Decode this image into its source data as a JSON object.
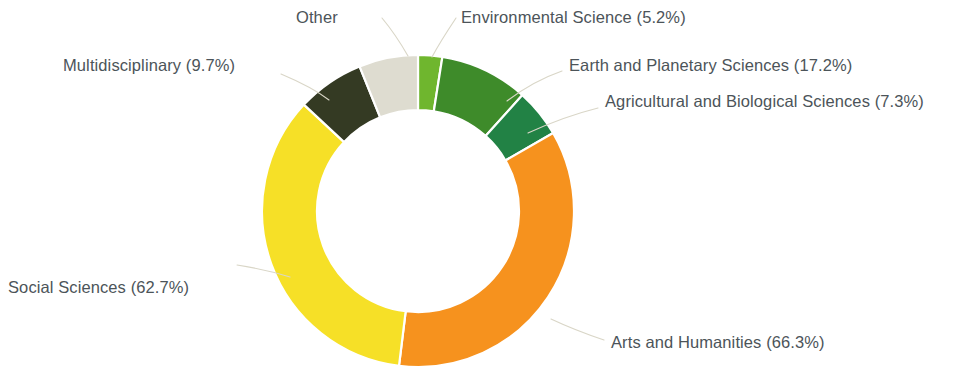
{
  "chart_data": {
    "type": "pie",
    "variant": "donut",
    "title": "",
    "subtitle": "",
    "xlabel": "",
    "ylabel": "",
    "legend_position": "none",
    "labels_position": "outside-with-leader-lines",
    "grid": false,
    "value_unit": "percent",
    "categories": [
      "Environmental Science",
      "Earth and Planetary Sciences",
      "Agricultural and Biological Sciences",
      "Arts and Humanities",
      "Social Sciences",
      "Multidisciplinary",
      "Other"
    ],
    "values": [
      5.2,
      17.2,
      7.3,
      66.3,
      62.7,
      9.7,
      0
    ],
    "slices": [
      {
        "name": "Environmental Science",
        "value": 5.2,
        "label": "Environmental Science (5.2%)",
        "color": "#6FB62E",
        "start_angle": 0,
        "end_angle": 9,
        "leader_name": "leader-environmental-science"
      },
      {
        "name": "Earth and Planetary Sciences",
        "value": 17.2,
        "label": "Earth and Planetary Sciences (17.2%)",
        "color": "#3E8B2A",
        "start_angle": 9,
        "end_angle": 42,
        "leader_name": "leader-earth-and-planetary-sciences"
      },
      {
        "name": "Agricultural and Biological Sciences",
        "value": 7.3,
        "label": "Agricultural and Biological Sciences (7.3%)",
        "color": "#228245",
        "start_angle": 42,
        "end_angle": 60,
        "leader_name": "leader-agricultural-and-biological-sciences"
      },
      {
        "name": "Arts and Humanities",
        "value": 66.3,
        "label": "Arts and Humanities (66.3%)",
        "color": "#F6921E",
        "start_angle": 60,
        "end_angle": 187,
        "leader_name": "leader-arts-and-humanities"
      },
      {
        "name": "Social Sciences",
        "value": 62.7,
        "label": "Social Sciences (62.7%)",
        "color": "#F6E027",
        "start_angle": 187,
        "end_angle": 313,
        "leader_name": "leader-social-sciences"
      },
      {
        "name": "Multidisciplinary",
        "value": 9.7,
        "label": "Multidisciplinary (9.7%)",
        "color": "#343A23",
        "start_angle": 313,
        "end_angle": 338,
        "leader_name": "leader-multidisciplinary"
      },
      {
        "name": "Other",
        "value": null,
        "label": "Other",
        "color": "#DEDCD0",
        "start_angle": 338,
        "end_angle": 360,
        "leader_name": "leader-other"
      }
    ],
    "geometry": {
      "center_x": 418,
      "center_y": 211,
      "outer_radius": 156,
      "inner_radius": 101
    },
    "colors": {
      "environmental_science": "#6FB62E",
      "earth_and_planetary_sciences": "#3E8B2A",
      "agricultural_and_biological_sciences": "#228245",
      "arts_and_humanities": "#F6921E",
      "social_sciences": "#F6E027",
      "multidisciplinary": "#343A23",
      "other": "#DEDCD0",
      "label_text": "#4C5459",
      "leader_line": "#D9D6C7",
      "background": "#FFFFFF"
    }
  }
}
